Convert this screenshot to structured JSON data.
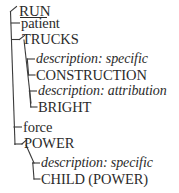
{
  "diagram": {
    "type": "semantic-network-tree",
    "title_visible": false,
    "colors": {
      "text": "#2b2b2b",
      "line": "#3a3a3a",
      "background": "#ffffff"
    },
    "root": {
      "label": "RUN",
      "underlined": true
    },
    "branches": [
      {
        "id": "patient",
        "role_label": "patient",
        "style": "roman",
        "concept": {
          "label": "TRUCKS",
          "style": "caps"
        },
        "children": [
          {
            "relation": "description: specific",
            "value": "CONSTRUCTION"
          },
          {
            "relation": "description: attribution",
            "value": "BRIGHT"
          }
        ]
      },
      {
        "id": "force",
        "role_label": "force",
        "style": "roman",
        "concept": {
          "label": "POWER",
          "style": "caps"
        },
        "children": [
          {
            "relation": "description: specific",
            "value": "CHILD (POWER)"
          }
        ]
      }
    ],
    "rows": [
      {
        "key": "root",
        "text": "RUN"
      },
      {
        "key": "role-patient",
        "text": "patient"
      },
      {
        "key": "node-trucks",
        "text": "TRUCKS"
      },
      {
        "key": "rel-specific-1",
        "text": "description: specific"
      },
      {
        "key": "val-construction",
        "text": "CONSTRUCTION"
      },
      {
        "key": "rel-attribution",
        "text": "description: attribution"
      },
      {
        "key": "val-bright",
        "text": "BRIGHT"
      },
      {
        "key": "role-force",
        "text": "force"
      },
      {
        "key": "node-power",
        "text": "POWER"
      },
      {
        "key": "rel-specific-2",
        "text": "description: specific"
      },
      {
        "key": "val-child-power",
        "text": "CHILD (POWER)"
      }
    ]
  }
}
